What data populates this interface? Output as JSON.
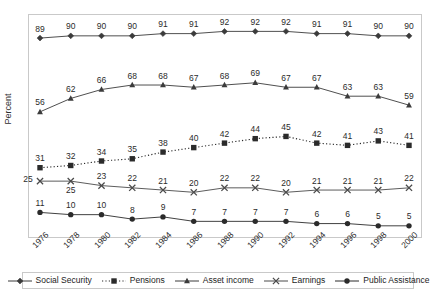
{
  "chart_data": {
    "type": "line",
    "title": "",
    "xlabel": "",
    "ylabel": "Percent",
    "categories": [
      "1976",
      "1978",
      "1980",
      "1982",
      "1984",
      "1986",
      "1988",
      "1990",
      "1992",
      "1994",
      "1996",
      "1998",
      "2000"
    ],
    "ylim": [
      0,
      100
    ],
    "grid": false,
    "legend_position": "bottom",
    "series": [
      {
        "name": "Social Security",
        "marker": "diamond",
        "line_style": "solid",
        "color": "#3b3b3b",
        "values": [
          89,
          90,
          90,
          90,
          91,
          91,
          92,
          92,
          92,
          91,
          91,
          90,
          90
        ]
      },
      {
        "name": "Pensions",
        "marker": "square",
        "line_style": "dotted",
        "color": "#2b2b2b",
        "values": [
          31,
          32,
          34,
          35,
          38,
          40,
          42,
          44,
          45,
          42,
          41,
          43,
          41
        ]
      },
      {
        "name": "Asset income",
        "marker": "triangle",
        "line_style": "solid",
        "color": "#3b3b3b",
        "values": [
          56,
          62,
          66,
          68,
          68,
          67,
          68,
          69,
          67,
          67,
          63,
          63,
          59
        ]
      },
      {
        "name": "Earnings",
        "marker": "cross",
        "line_style": "solid",
        "color": "#4a4a4a",
        "values": [
          25,
          25,
          23,
          22,
          21,
          20,
          22,
          22,
          20,
          21,
          21,
          21,
          22
        ]
      },
      {
        "name": "Public Assistance",
        "marker": "circle",
        "line_style": "solid",
        "color": "#2b2b2b",
        "values": [
          11,
          10,
          10,
          8,
          9,
          7,
          7,
          7,
          7,
          6,
          6,
          5,
          5
        ]
      }
    ]
  },
  "axis": {
    "y_label": "Percent"
  },
  "legend": {
    "items": [
      {
        "label": "Social Security"
      },
      {
        "label": "Pensions"
      },
      {
        "label": "Asset income"
      },
      {
        "label": "Earnings"
      },
      {
        "label": "Public Assistance"
      }
    ]
  },
  "style": {
    "plot_border_color": "#c9c9c9",
    "background": "#ffffff",
    "label_color": "#2b2b2b"
  }
}
